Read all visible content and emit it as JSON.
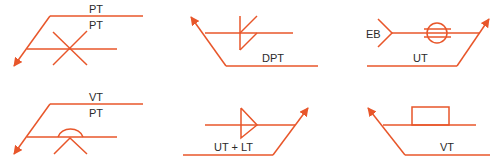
{
  "diagram": {
    "title": "",
    "stroke_color": "#e8562a",
    "text_color": "#2a2a2a",
    "symbols": [
      {
        "id": "panel-1",
        "labels": {
          "top": "PT",
          "middle": "PT"
        },
        "symbol": "x-cross-both-sides"
      },
      {
        "id": "panel-2",
        "labels": {
          "bottom": "DPT"
        },
        "symbol": "fillet-weld-double"
      },
      {
        "id": "panel-3",
        "labels": {
          "tail": "EB",
          "bottom": "UT"
        },
        "symbol": "circle-with-bars"
      },
      {
        "id": "panel-4",
        "labels": {
          "top": "VT",
          "middle": "PT"
        },
        "symbol": "arc-over-inverted-v"
      },
      {
        "id": "panel-5",
        "labels": {
          "bottom": "UT + LT"
        },
        "symbol": "triangle-flag"
      },
      {
        "id": "panel-6",
        "labels": {
          "bottom": "VT"
        },
        "symbol": "rectangle-backing"
      }
    ]
  }
}
